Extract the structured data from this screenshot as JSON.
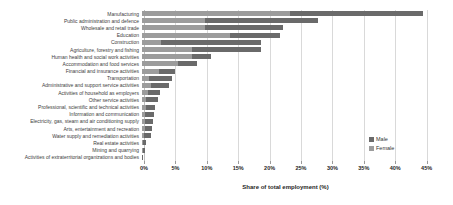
{
  "chart_data": {
    "type": "bar",
    "orientation": "horizontal",
    "stacked": true,
    "title": "",
    "xlabel": "Share of total employment (%)",
    "ylabel": "",
    "xlim": [
      0,
      45
    ],
    "x_tick_values": [
      0,
      5,
      10,
      15,
      20,
      25,
      30,
      35,
      40,
      45
    ],
    "x_tick_labels": [
      "0%",
      "5%",
      "10%",
      "15%",
      "20%",
      "25%",
      "30%",
      "35%",
      "40%",
      "45%"
    ],
    "grid": "vertical-light-gray",
    "legend_position": "right-inside-bottom",
    "stack_left_to_right": [
      "Female",
      "Male"
    ],
    "categories": [
      "Manufacturing",
      "Public administration and defence",
      "Wholesale and retail trade",
      "Education",
      "Construction",
      "Agriculture, forestry and fishing",
      "Human health and social work activities",
      "Accommodation and food services",
      "Financial and insurance activities",
      "Transportation",
      "Administrative and support service activities",
      "Activities of household as employers",
      "Other service activities",
      "Professional, scientific and technical activities",
      "Information and communication",
      "Electricity, gas, steam and air conditioning supply",
      "Arts, entertainment and recreation",
      "Water supply and remediation activities",
      "Real estate activities",
      "Mining and quarrying",
      "Activities of extraterritorial organizations and bodies"
    ],
    "series": [
      {
        "name": "Male",
        "color": "#6a6a6a",
        "values": [
          21.3,
          18.0,
          12.5,
          8.0,
          16.0,
          11.0,
          3.0,
          2.9,
          2.6,
          3.7,
          2.9,
          1.9,
          1.8,
          1.5,
          1.4,
          1.3,
          1.2,
          1.1,
          0.5,
          0.35,
          0.1
        ]
      },
      {
        "name": "Female",
        "color": "#9c9c9c",
        "values": [
          23.5,
          10.0,
          10.0,
          14.0,
          3.0,
          8.0,
          8.0,
          5.8,
          2.7,
          1.1,
          1.4,
          0.9,
          0.7,
          0.6,
          0.5,
          0.4,
          0.4,
          0.3,
          0.2,
          0.15,
          0.05
        ]
      }
    ]
  },
  "axis": {
    "x_title": "Share of total employment (%)"
  },
  "legend": {
    "male_label": "Male",
    "female_label": "Female"
  }
}
